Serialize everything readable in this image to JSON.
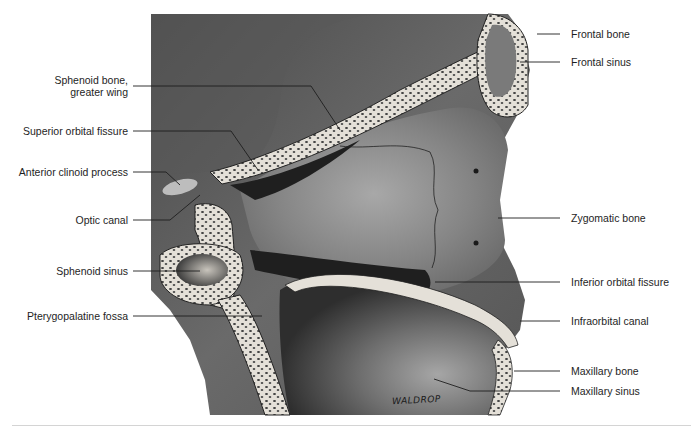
{
  "figure": {
    "signature": "WALDROP",
    "colors": {
      "background": "#ffffff",
      "tissue_dark": "#3a3a3a",
      "tissue_mid": "#6e6e6e",
      "tissue_light": "#9a9a9a",
      "bone_cortex": "#e6e2da",
      "bone_trabecula": "#3a3a3a",
      "leader_line": "#1e1e1e",
      "label_text": "#1e1e1e",
      "separator": "#d4d4d4"
    }
  },
  "labels_left": [
    {
      "id": "sphenoid-greater-wing",
      "line1": "Sphenoid bone,",
      "line2": "greater wing"
    },
    {
      "id": "superior-orbital-fissure",
      "line1": "Superior orbital fissure"
    },
    {
      "id": "anterior-clinoid-process",
      "line1": "Anterior clinoid process"
    },
    {
      "id": "optic-canal",
      "line1": "Optic canal"
    },
    {
      "id": "sphenoid-sinus",
      "line1": "Sphenoid sinus"
    },
    {
      "id": "pterygopalatine-fossa",
      "line1": "Pterygopalatine fossa"
    }
  ],
  "labels_right": [
    {
      "id": "frontal-bone",
      "line1": "Frontal bone"
    },
    {
      "id": "frontal-sinus",
      "line1": "Frontal sinus"
    },
    {
      "id": "zygomatic-bone",
      "line1": "Zygomatic bone"
    },
    {
      "id": "inferior-orbital-fissure",
      "line1": "Inferior orbital fissure"
    },
    {
      "id": "infraorbital-canal",
      "line1": "Infraorbital canal"
    },
    {
      "id": "maxillary-bone",
      "line1": "Maxillary bone"
    },
    {
      "id": "maxillary-sinus",
      "line1": "Maxillary sinus"
    }
  ]
}
